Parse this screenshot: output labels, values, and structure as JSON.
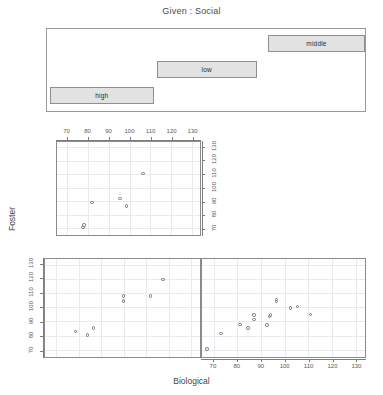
{
  "figure": {
    "title": "Given : Social",
    "xlabel": "Biological",
    "ylabel": "Foster",
    "type": "coplot"
  },
  "given_bars": [
    {
      "label": "middle",
      "row": 0
    },
    {
      "label": "low",
      "row": 1
    },
    {
      "label": "high",
      "row": 2
    }
  ],
  "axis": {
    "x_ticks": [
      "70",
      "80",
      "90",
      "100",
      "110",
      "120",
      "130"
    ],
    "y_ticks": [
      "70",
      "80",
      "90",
      "100",
      "110",
      "120",
      "130"
    ],
    "x_values": [
      70,
      80,
      90,
      100,
      110,
      120,
      130
    ],
    "y_values": [
      70,
      80,
      90,
      100,
      110,
      120,
      130
    ],
    "xlim": [
      65,
      134
    ],
    "ylim": [
      65,
      134
    ]
  },
  "chart_data": {
    "type": "scatter",
    "title": "Given : Social",
    "xlabel": "Biological",
    "ylabel": "Foster",
    "conditioning_variable": "Social",
    "conditioning_levels": [
      "high",
      "low",
      "middle"
    ],
    "xlim": [
      65,
      134
    ],
    "ylim": [
      65,
      134
    ],
    "xticks": [
      70,
      80,
      90,
      100,
      110,
      120,
      130
    ],
    "yticks": [
      70,
      80,
      90,
      100,
      110,
      120,
      130
    ],
    "grid": true,
    "legend": "none",
    "panels": [
      {
        "name": "panel-top-left",
        "panel_row": 0,
        "panel_col": 0,
        "condition": "middle",
        "points": [
          {
            "x": 78.0,
            "y": 72.5
          },
          {
            "x": 77.5,
            "y": 70.5
          },
          {
            "x": 82.0,
            "y": 89.0
          },
          {
            "x": 95.5,
            "y": 92.0
          },
          {
            "x": 98.5,
            "y": 86.5
          },
          {
            "x": 106.5,
            "y": 110.5
          }
        ]
      },
      {
        "name": "panel-bottom-left",
        "panel_row": 1,
        "panel_col": 0,
        "condition": "high",
        "points": [
          {
            "x": 78.5,
            "y": 83.0
          },
          {
            "x": 84.0,
            "y": 80.5
          },
          {
            "x": 86.5,
            "y": 85.5
          },
          {
            "x": 100.0,
            "y": 108.0
          },
          {
            "x": 100.0,
            "y": 104.5
          },
          {
            "x": 112.0,
            "y": 108.0
          },
          {
            "x": 117.5,
            "y": 119.5
          }
        ]
      },
      {
        "name": "panel-bottom-right",
        "panel_row": 1,
        "panel_col": 1,
        "condition": "low",
        "points": [
          {
            "x": 67.0,
            "y": 70.5
          },
          {
            "x": 73.0,
            "y": 81.5
          },
          {
            "x": 81.0,
            "y": 88.0
          },
          {
            "x": 84.5,
            "y": 85.5
          },
          {
            "x": 87.0,
            "y": 94.5
          },
          {
            "x": 87.0,
            "y": 91.5
          },
          {
            "x": 92.5,
            "y": 87.5
          },
          {
            "x": 93.5,
            "y": 93.5
          },
          {
            "x": 94.0,
            "y": 94.5
          },
          {
            "x": 96.5,
            "y": 104.0
          },
          {
            "x": 96.5,
            "y": 105.5
          },
          {
            "x": 102.5,
            "y": 99.5
          },
          {
            "x": 105.5,
            "y": 100.5
          },
          {
            "x": 111.0,
            "y": 95.0
          }
        ]
      }
    ]
  },
  "colors": {
    "background": "#ffffff",
    "panel_border": "#8a8a8a",
    "grid": "#e9e9ee",
    "point_stroke": "#6f6f78",
    "given_bar_fill": "#e2e2e2",
    "given_bar_border": "#8f8f8f",
    "text": "#3f3f3f"
  }
}
